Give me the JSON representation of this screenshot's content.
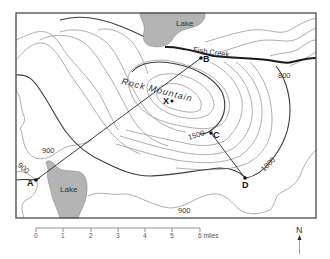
{
  "map": {
    "type": "topographic-map",
    "features": {
      "lake_north": {
        "label": "Lake"
      },
      "lake_southwest": {
        "label": "Lake"
      },
      "creek": {
        "label": "Fish Creek"
      },
      "mountain": {
        "label": "Rock Mountain"
      }
    },
    "contour_labels": {
      "c800": "800",
      "c900_west_upper": "900",
      "c900_west_lower": "900",
      "c900_south": "900",
      "c1000": "1000",
      "c1500": "1500"
    },
    "points": {
      "A": "A",
      "B": "B",
      "C": "C",
      "D": "D",
      "X": "X"
    },
    "profile_lines": [
      "A-B",
      "C-D"
    ],
    "scale_bar": {
      "ticks": [
        "0",
        "1",
        "2",
        "3",
        "4",
        "5",
        "6 miles"
      ],
      "unit": "miles"
    },
    "north_arrow": {
      "label": "N"
    },
    "colors": {
      "lake_fill": "#b4b4b4",
      "contour": "#9a9a9a",
      "index_contour": "#3c3c3c",
      "creek": "#1a1a1a"
    }
  }
}
